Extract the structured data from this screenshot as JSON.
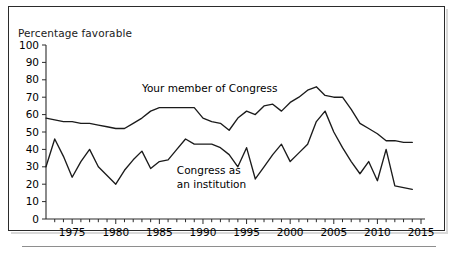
{
  "figure": {
    "axis_title": "Percentage favorable",
    "series_labels": {
      "member": "Your member of Congress",
      "institution_line1": "Congress as",
      "institution_line2": "an institution"
    }
  },
  "chart_data": {
    "type": "line",
    "title": "",
    "subtitle": "",
    "xlabel": "",
    "ylabel": "Percentage favorable",
    "xlim": [
      1972,
      2015
    ],
    "ylim": [
      0,
      100
    ],
    "ytick_labels": [
      "0",
      "10",
      "20",
      "30",
      "40",
      "50",
      "60",
      "70",
      "80",
      "90",
      "100"
    ],
    "ytick_values": [
      0,
      10,
      20,
      30,
      40,
      50,
      60,
      70,
      80,
      90,
      100
    ],
    "xtick_labels": [
      "1975",
      "1980",
      "1985",
      "1990",
      "1995",
      "2000",
      "2005",
      "2010",
      "2015"
    ],
    "xtick_values": [
      1975,
      1980,
      1985,
      1990,
      1995,
      2000,
      2005,
      2010,
      2015
    ],
    "xtick_minor_step": 1,
    "grid": false,
    "legend": "inline-annotations",
    "line_color": "#1b1b1b",
    "series": [
      {
        "name": "Your member of Congress",
        "x": [
          1972,
          1973,
          1974,
          1975,
          1976,
          1977,
          1978,
          1979,
          1980,
          1981,
          1982,
          1983,
          1984,
          1985,
          1986,
          1987,
          1988,
          1989,
          1990,
          1991,
          1992,
          1993,
          1994,
          1995,
          1996,
          1997,
          1998,
          1999,
          2000,
          2001,
          2002,
          2003,
          2004,
          2005,
          2006,
          2007,
          2008,
          2009,
          2010,
          2011,
          2012,
          2013,
          2014
        ],
        "values": [
          58,
          57,
          56,
          56,
          55,
          55,
          54,
          53,
          52,
          52,
          55,
          58,
          62,
          64,
          64,
          64,
          64,
          64,
          58,
          56,
          55,
          51,
          58,
          62,
          60,
          65,
          66,
          62,
          67,
          70,
          74,
          76,
          71,
          70,
          70,
          63,
          55,
          52,
          49,
          45,
          45,
          44,
          44
        ]
      },
      {
        "name": "Congress as an institution",
        "x": [
          1972,
          1973,
          1974,
          1975,
          1976,
          1977,
          1978,
          1979,
          1980,
          1981,
          1982,
          1983,
          1984,
          1985,
          1986,
          1987,
          1988,
          1989,
          1990,
          1991,
          1992,
          1993,
          1994,
          1995,
          1996,
          1997,
          1998,
          1999,
          2000,
          2001,
          2002,
          2003,
          2004,
          2005,
          2006,
          2007,
          2008,
          2009,
          2010,
          2011,
          2012,
          2013,
          2014
        ],
        "values": [
          30,
          46,
          36,
          24,
          33,
          40,
          30,
          25,
          20,
          28,
          34,
          39,
          29,
          33,
          34,
          40,
          46,
          43,
          43,
          43,
          41,
          37,
          30,
          41,
          23,
          30,
          37,
          43,
          33,
          38,
          43,
          56,
          62,
          50,
          41,
          33,
          26,
          33,
          22,
          40,
          19,
          18,
          17
        ]
      }
    ],
    "annotations": [
      {
        "text": "Your member of Congress",
        "x": 1983,
        "y": 73
      },
      {
        "text": "Congress as",
        "x": 1987,
        "y": 26
      },
      {
        "text": "an institution",
        "x": 1987,
        "y": 18
      }
    ]
  }
}
